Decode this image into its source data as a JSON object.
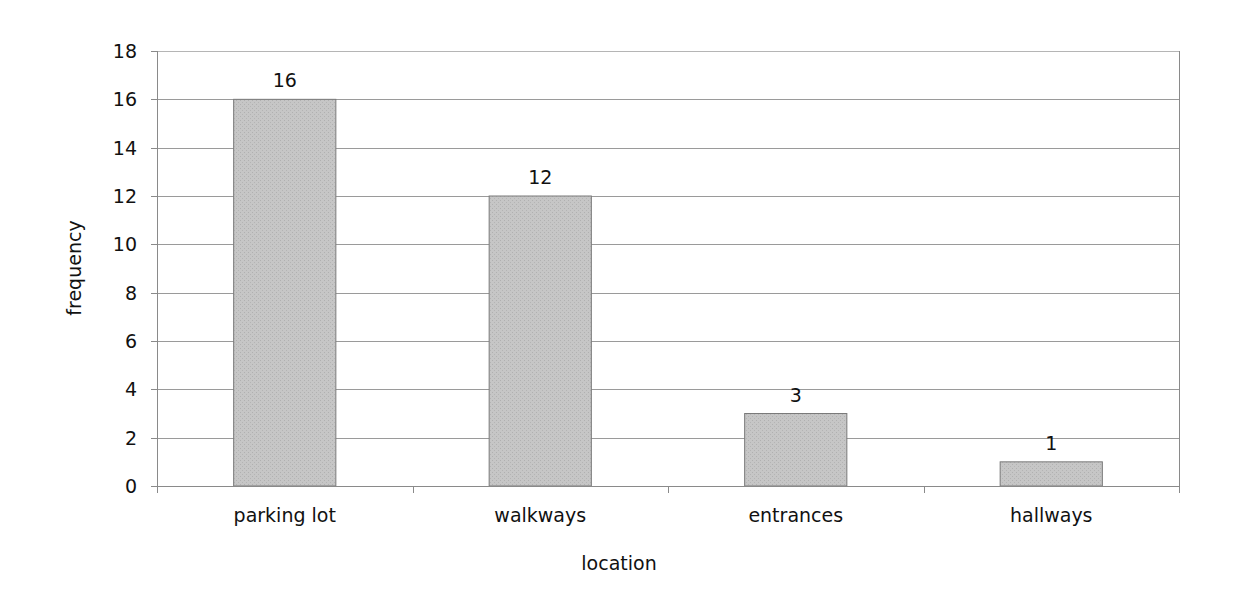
{
  "chart_data": {
    "type": "bar",
    "title": "",
    "xlabel": "location",
    "ylabel": "frequency",
    "categories": [
      "parking lot",
      "walkways",
      "entrances",
      "hallways"
    ],
    "values": [
      16,
      12,
      3,
      1
    ],
    "data_labels": [
      "16",
      "12",
      "3",
      "1"
    ],
    "ylim": [
      0,
      18
    ],
    "yticks": [
      0,
      2,
      4,
      6,
      8,
      10,
      12,
      14,
      16,
      18
    ],
    "ytick_labels": [
      "0",
      "2",
      "4",
      "6",
      "8",
      "10",
      "12",
      "14",
      "16",
      "18"
    ],
    "grid": true,
    "legend": null
  },
  "colors": {
    "bar_fill": "#c4c4c4",
    "bar_stroke": "#7a7a7a",
    "gridline": "#9a9a9a",
    "axis": "#8a8a8a",
    "text": "#111111"
  }
}
